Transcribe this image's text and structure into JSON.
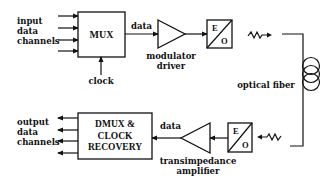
{
  "diagram": {
    "type": "optical fiber transmission link block diagram",
    "colors": {
      "ink": "#111111",
      "background": "#ffffff"
    },
    "transmitter": {
      "input_label": [
        "input",
        "data",
        "channels"
      ],
      "input_channel_count": 4,
      "mux": {
        "label": "MUX"
      },
      "clock_label": "clock",
      "data_label": "data",
      "driver": {
        "label": [
          "modulator",
          "driver"
        ]
      },
      "eo": {
        "top": "E",
        "bottom": "O"
      }
    },
    "channel": {
      "label": "optical fiber"
    },
    "receiver": {
      "eo": {
        "top": "E",
        "bottom": "O"
      },
      "amplifier": {
        "label": [
          "transimpedance",
          "amplifier"
        ]
      },
      "data_label": "data",
      "dmux": {
        "label": [
          "DMUX &",
          "CLOCK",
          "RECOVERY"
        ]
      },
      "output_label": [
        "output",
        "data",
        "channels"
      ],
      "output_channel_count": 4
    }
  }
}
